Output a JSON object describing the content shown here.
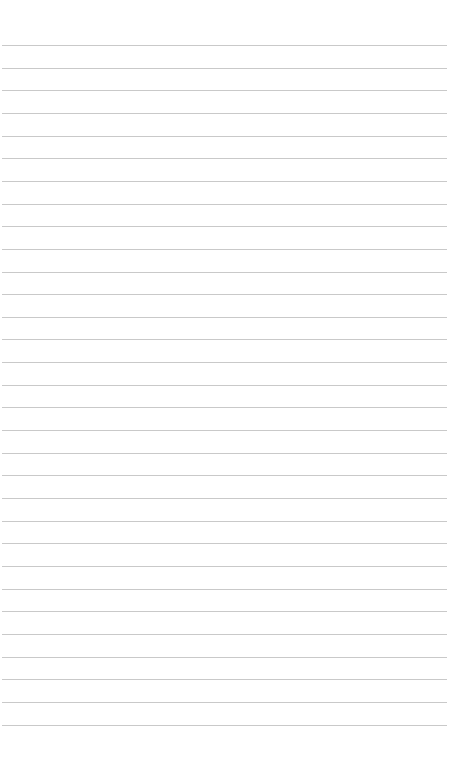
{
  "page": {
    "type": "lined-paper",
    "background": "#ffffff",
    "rule_color": "#c9c9c9",
    "rule_count": 31,
    "first_rule_y": 45,
    "rule_spacing": 22.65
  }
}
